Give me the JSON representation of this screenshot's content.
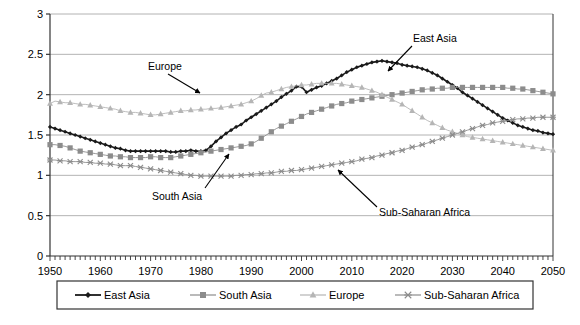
{
  "chart_data": {
    "type": "line",
    "title": "",
    "xlabel": "",
    "ylabel": "",
    "xlim": [
      1950,
      2050
    ],
    "ylim": [
      0,
      3
    ],
    "ytick_labels": [
      "0",
      "0.5",
      "1",
      "1.5",
      "2",
      "2.5",
      "3"
    ],
    "ytick_values": [
      0,
      0.5,
      1,
      1.5,
      2,
      2.5,
      3
    ],
    "xtick_labels": [
      "1950",
      "1960",
      "1970",
      "1980",
      "1990",
      "2000",
      "2010",
      "2020",
      "2030",
      "2040",
      "2050"
    ],
    "xtick_values": [
      1950,
      1960,
      1970,
      1980,
      1990,
      2000,
      2010,
      2020,
      2030,
      2040,
      2050
    ],
    "minor_xtick_step": 1,
    "grid": "horizontal",
    "legend_position": "bottom",
    "x": [
      1950,
      1951,
      1952,
      1953,
      1954,
      1955,
      1956,
      1957,
      1958,
      1959,
      1960,
      1961,
      1962,
      1963,
      1964,
      1965,
      1966,
      1967,
      1968,
      1969,
      1970,
      1971,
      1972,
      1973,
      1974,
      1975,
      1976,
      1977,
      1978,
      1979,
      1980,
      1981,
      1982,
      1983,
      1984,
      1985,
      1986,
      1987,
      1988,
      1989,
      1990,
      1991,
      1992,
      1993,
      1994,
      1995,
      1996,
      1997,
      1998,
      1999,
      2000,
      2001,
      2002,
      2003,
      2004,
      2005,
      2006,
      2007,
      2008,
      2009,
      2010,
      2011,
      2012,
      2013,
      2014,
      2015,
      2016,
      2017,
      2018,
      2019,
      2020,
      2021,
      2022,
      2023,
      2024,
      2025,
      2026,
      2027,
      2028,
      2029,
      2030,
      2031,
      2032,
      2033,
      2034,
      2035,
      2036,
      2037,
      2038,
      2039,
      2040,
      2041,
      2042,
      2043,
      2044,
      2045,
      2046,
      2047,
      2048,
      2049,
      2050
    ],
    "series": [
      {
        "name": "East Asia",
        "color": "#1a1a1a",
        "marker": "diamond",
        "values": [
          1.6,
          1.58,
          1.56,
          1.54,
          1.52,
          1.5,
          1.48,
          1.46,
          1.44,
          1.42,
          1.4,
          1.38,
          1.36,
          1.34,
          1.33,
          1.31,
          1.3,
          1.3,
          1.3,
          1.3,
          1.3,
          1.3,
          1.3,
          1.3,
          1.29,
          1.29,
          1.3,
          1.3,
          1.31,
          1.3,
          1.3,
          1.31,
          1.36,
          1.42,
          1.47,
          1.52,
          1.56,
          1.6,
          1.63,
          1.68,
          1.72,
          1.76,
          1.8,
          1.84,
          1.88,
          1.92,
          1.97,
          2.01,
          2.05,
          2.1,
          2.1,
          2.03,
          2.06,
          2.09,
          2.11,
          2.14,
          2.17,
          2.2,
          2.24,
          2.28,
          2.31,
          2.34,
          2.36,
          2.38,
          2.4,
          2.41,
          2.42,
          2.41,
          2.4,
          2.39,
          2.37,
          2.36,
          2.35,
          2.34,
          2.32,
          2.3,
          2.27,
          2.24,
          2.2,
          2.16,
          2.12,
          2.08,
          2.03,
          1.99,
          1.95,
          1.91,
          1.87,
          1.83,
          1.79,
          1.75,
          1.71,
          1.68,
          1.65,
          1.62,
          1.6,
          1.58,
          1.56,
          1.55,
          1.53,
          1.52,
          1.51
        ]
      },
      {
        "name": "South Asia",
        "color": "#8c8c8c",
        "marker": "square",
        "values": [
          1.38,
          1.38,
          1.37,
          1.36,
          1.34,
          1.32,
          1.3,
          1.29,
          1.28,
          1.27,
          1.26,
          1.25,
          1.24,
          1.24,
          1.23,
          1.23,
          1.22,
          1.22,
          1.22,
          1.22,
          1.23,
          1.23,
          1.22,
          1.22,
          1.22,
          1.23,
          1.24,
          1.25,
          1.26,
          1.27,
          1.28,
          1.29,
          1.3,
          1.31,
          1.32,
          1.33,
          1.34,
          1.35,
          1.36,
          1.37,
          1.39,
          1.42,
          1.46,
          1.5,
          1.54,
          1.58,
          1.61,
          1.64,
          1.67,
          1.7,
          1.73,
          1.76,
          1.78,
          1.8,
          1.82,
          1.84,
          1.86,
          1.88,
          1.89,
          1.9,
          1.92,
          1.93,
          1.94,
          1.95,
          1.96,
          1.97,
          1.98,
          1.99,
          2.0,
          2.01,
          2.02,
          2.03,
          2.04,
          2.05,
          2.06,
          2.07,
          2.07,
          2.08,
          2.08,
          2.08,
          2.09,
          2.09,
          2.09,
          2.09,
          2.09,
          2.09,
          2.09,
          2.09,
          2.09,
          2.09,
          2.09,
          2.08,
          2.08,
          2.07,
          2.07,
          2.06,
          2.05,
          2.04,
          2.03,
          2.02,
          2.01
        ]
      },
      {
        "name": "Europe",
        "color": "#b5b5b5",
        "marker": "triangle",
        "values": [
          1.89,
          1.92,
          1.91,
          1.9,
          1.9,
          1.89,
          1.88,
          1.88,
          1.87,
          1.86,
          1.85,
          1.84,
          1.83,
          1.82,
          1.8,
          1.79,
          1.78,
          1.78,
          1.77,
          1.76,
          1.75,
          1.75,
          1.76,
          1.77,
          1.78,
          1.79,
          1.8,
          1.8,
          1.81,
          1.81,
          1.82,
          1.82,
          1.83,
          1.83,
          1.84,
          1.85,
          1.86,
          1.87,
          1.88,
          1.9,
          1.92,
          1.95,
          1.99,
          2.02,
          2.03,
          2.05,
          2.07,
          2.09,
          2.1,
          2.11,
          2.12,
          2.12,
          2.13,
          2.14,
          2.14,
          2.14,
          2.14,
          2.14,
          2.13,
          2.12,
          2.11,
          2.1,
          2.09,
          2.07,
          2.05,
          2.03,
          2.0,
          1.97,
          1.94,
          1.91,
          1.88,
          1.84,
          1.8,
          1.76,
          1.72,
          1.68,
          1.65,
          1.62,
          1.59,
          1.56,
          1.54,
          1.52,
          1.5,
          1.48,
          1.47,
          1.46,
          1.45,
          1.44,
          1.43,
          1.42,
          1.41,
          1.4,
          1.39,
          1.38,
          1.37,
          1.36,
          1.35,
          1.34,
          1.33,
          1.32,
          1.31
        ]
      },
      {
        "name": "Sub-Saharan Africa",
        "color": "#8c8c8c",
        "marker": "asterisk",
        "values": [
          1.19,
          1.19,
          1.18,
          1.18,
          1.17,
          1.17,
          1.17,
          1.16,
          1.16,
          1.15,
          1.15,
          1.14,
          1.14,
          1.13,
          1.12,
          1.12,
          1.12,
          1.11,
          1.1,
          1.09,
          1.08,
          1.07,
          1.06,
          1.05,
          1.04,
          1.03,
          1.02,
          1.01,
          1.0,
          1.0,
          0.99,
          0.99,
          0.99,
          0.99,
          0.99,
          0.99,
          0.99,
          1.0,
          1.0,
          1.01,
          1.01,
          1.02,
          1.02,
          1.03,
          1.03,
          1.04,
          1.05,
          1.05,
          1.06,
          1.06,
          1.07,
          1.08,
          1.09,
          1.1,
          1.11,
          1.12,
          1.13,
          1.14,
          1.15,
          1.16,
          1.17,
          1.18,
          1.2,
          1.21,
          1.22,
          1.24,
          1.25,
          1.27,
          1.28,
          1.3,
          1.31,
          1.33,
          1.35,
          1.36,
          1.38,
          1.4,
          1.42,
          1.44,
          1.46,
          1.48,
          1.5,
          1.52,
          1.54,
          1.56,
          1.58,
          1.6,
          1.62,
          1.63,
          1.65,
          1.66,
          1.67,
          1.68,
          1.69,
          1.7,
          1.7,
          1.71,
          1.71,
          1.72,
          1.72,
          1.72,
          1.72
        ]
      }
    ],
    "annotations": [
      {
        "text": "Europe",
        "label_x": 148,
        "label_y": 70,
        "tip_x": 200,
        "tip_y": 93,
        "tail_x": 168,
        "tail_y": 74
      },
      {
        "text": "East Asia",
        "label_x": 413,
        "label_y": 42,
        "tip_x": 388,
        "tip_y": 71,
        "tail_x": 412,
        "tail_y": 46
      },
      {
        "text": "South Asia",
        "label_x": 152,
        "label_y": 200,
        "tip_x": 229,
        "tip_y": 154,
        "tail_x": 205,
        "tail_y": 188
      },
      {
        "text": "Sub-Saharan Africa",
        "label_x": 379,
        "label_y": 216,
        "tip_x": 338,
        "tip_y": 170,
        "tail_x": 377,
        "tail_y": 207
      }
    ]
  },
  "legend": {
    "items": [
      {
        "label": "East Asia",
        "color": "#1a1a1a",
        "marker": "diamond"
      },
      {
        "label": "South Asia",
        "color": "#8c8c8c",
        "marker": "square"
      },
      {
        "label": "Europe",
        "color": "#b5b5b5",
        "marker": "triangle"
      },
      {
        "label": "Sub-Saharan Africa",
        "color": "#8c8c8c",
        "marker": "asterisk"
      }
    ]
  },
  "colors": {
    "axis": "#333333",
    "grid": "#a0a0a0",
    "background": "#ffffff",
    "text": "#000000"
  }
}
